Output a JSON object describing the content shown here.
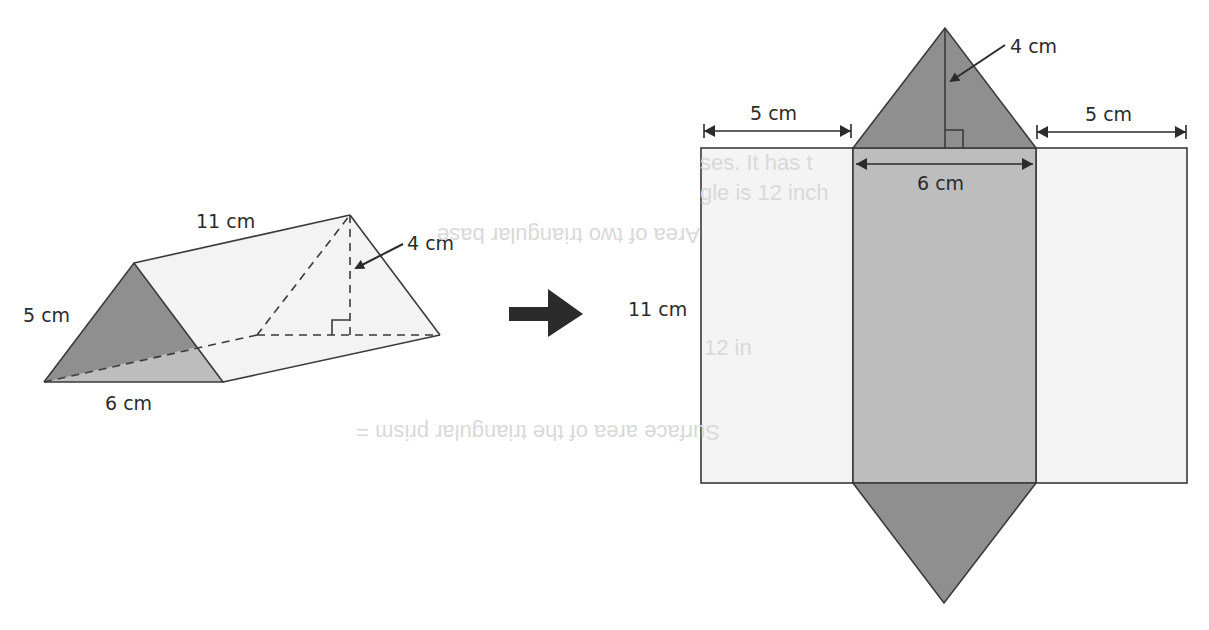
{
  "prism": {
    "length_label": "11 cm",
    "slant_label": "5 cm",
    "base_label": "6 cm",
    "height_label": "4 cm"
  },
  "arrow": {
    "icon": "right-arrow-icon"
  },
  "net": {
    "left_width_label": "5 cm",
    "right_width_label": "5 cm",
    "middle_width_label": "6 cm",
    "triangle_height_label": "4 cm",
    "length_label": "11 cm",
    "bleed_through_text": [
      "ses. It has t",
      "gle is 12 inch",
      "Area of two triangular base",
      "12 in",
      "Surface area of the triangular prism ="
    ]
  },
  "colors": {
    "dark_face": "#8f8f8f",
    "mid_face": "#bdbdbd",
    "light_face": "#f1f1f1",
    "bottom_face": "#c4c4c4",
    "edge": "#3a3a3a",
    "text": "#2b2b2b"
  }
}
